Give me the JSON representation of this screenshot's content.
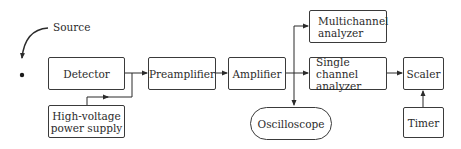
{
  "diagram": {
    "type": "block-diagram",
    "source_label": "Source",
    "blocks": {
      "detector": "Detector",
      "hv_supply_line1": "High-voltage",
      "hv_supply_line2": "power supply",
      "preamplifier": "Preamplifier",
      "amplifier": "Amplifier",
      "multichannel_line1": "Multichannel",
      "multichannel_line2": "analyzer",
      "single_channel_line1": "Single channel",
      "single_channel_line2": "analyzer",
      "scaler": "Scaler",
      "timer": "Timer",
      "oscilloscope": "Oscilloscope"
    },
    "connections": [
      {
        "from": "Source",
        "to": "Detector"
      },
      {
        "from": "High-voltage power supply",
        "to": "Detector"
      },
      {
        "from": "Detector",
        "to": "Preamplifier"
      },
      {
        "from": "Preamplifier",
        "to": "Amplifier"
      },
      {
        "from": "Amplifier",
        "to": "Multichannel analyzer"
      },
      {
        "from": "Amplifier",
        "to": "Single channel analyzer"
      },
      {
        "from": "Amplifier",
        "to": "Oscilloscope"
      },
      {
        "from": "Single channel analyzer",
        "to": "Scaler"
      },
      {
        "from": "Timer",
        "to": "Scaler"
      }
    ],
    "colors": {
      "line": "#2b2b2b",
      "background": "#ffffff"
    }
  }
}
